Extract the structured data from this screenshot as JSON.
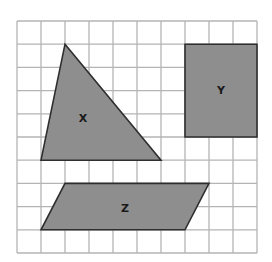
{
  "grid": {
    "columns": 10,
    "rows": 10,
    "origin_x": 17,
    "origin_y": 21,
    "cell_w": 24,
    "cell_h": 23.2,
    "line_color": "#b4b4b4"
  },
  "colors": {
    "fill": "#8e8e8e",
    "outline": "#2e2e2e",
    "label": "#1a1a1a"
  },
  "shapes": [
    {
      "id": "X",
      "type": "triangle",
      "label": "X",
      "vertices_grid": [
        [
          2,
          1
        ],
        [
          6,
          6
        ],
        [
          1,
          6
        ]
      ],
      "label_pos": [
        83,
        118
      ]
    },
    {
      "id": "Y",
      "type": "rectangle",
      "label": "Y",
      "vertices_grid": [
        [
          7,
          1
        ],
        [
          10,
          1
        ],
        [
          10,
          5
        ],
        [
          7,
          5
        ]
      ],
      "label_pos": [
        221,
        90
      ]
    },
    {
      "id": "Z",
      "type": "parallelogram",
      "label": "Z",
      "vertices_grid": [
        [
          2,
          7
        ],
        [
          8,
          7
        ],
        [
          7,
          9
        ],
        [
          1,
          9
        ]
      ],
      "label_pos": [
        125,
        208
      ]
    }
  ]
}
